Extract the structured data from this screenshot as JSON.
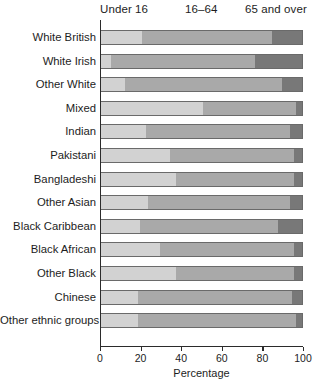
{
  "chart_data": {
    "type": "bar",
    "subtype": "stacked-horizontal-bar",
    "title": "",
    "xlabel": "Percentage",
    "ylabel": "",
    "xlim": [
      0,
      100
    ],
    "xticks": [
      0,
      20,
      40,
      60,
      80,
      100
    ],
    "grid": false,
    "legend_position": "top",
    "stacked": true,
    "categories": [
      "White British",
      "White Irish",
      "Other White",
      "Mixed",
      "Indian",
      "Pakistani",
      "Bangladeshi",
      "Other Asian",
      "Black Caribbean",
      "Black African",
      "Other Black",
      "Chinese",
      "Other ethnic groups"
    ],
    "series": [
      {
        "name": "Under 16",
        "color": "#d2d2d2",
        "values": [
          20,
          5,
          12,
          50,
          22,
          34,
          37,
          23,
          19,
          29,
          37,
          18,
          18
        ]
      },
      {
        "name": "16–64",
        "color": "#a9a9a9",
        "values": [
          64,
          71,
          77,
          46,
          71,
          61,
          58,
          70,
          68,
          66,
          58,
          76,
          78
        ]
      },
      {
        "name": "65 and over",
        "color": "#787878",
        "values": [
          16,
          24,
          11,
          4,
          7,
          5,
          5,
          7,
          13,
          5,
          5,
          6,
          4
        ]
      }
    ],
    "cumulative_boundaries": [
      [
        20,
        84
      ],
      [
        5,
        76
      ],
      [
        12,
        89
      ],
      [
        50,
        96
      ],
      [
        22,
        93
      ],
      [
        34,
        95
      ],
      [
        37,
        95
      ],
      [
        23,
        93
      ],
      [
        19,
        87
      ],
      [
        29,
        95
      ],
      [
        37,
        95
      ],
      [
        18,
        94
      ],
      [
        18,
        96
      ]
    ]
  },
  "legend": {
    "items": [
      {
        "label": "Under 16"
      },
      {
        "label": "16–64"
      },
      {
        "label": "65 and over"
      }
    ]
  },
  "axis": {
    "x_title": "Percentage",
    "x_tick_labels": [
      "0",
      "20",
      "40",
      "60",
      "80",
      "100"
    ]
  }
}
